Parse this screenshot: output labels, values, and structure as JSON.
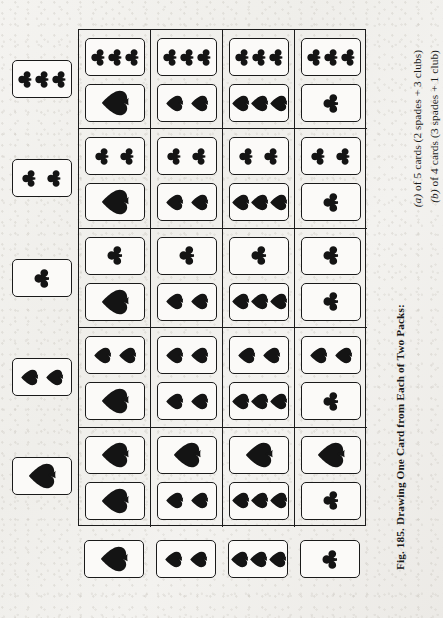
{
  "figure": {
    "number": "Fig. 185.",
    "caption_line1": "Fig. 185. Drawing One Card from Each of Two Packs:",
    "caption_line2": "(a) of 5 cards (2 spades + 3 clubs)",
    "caption_line3": "(b) of 4 cards (3 spades + 1 club)",
    "caption_a_label": "(a)",
    "caption_b_label": "(b)",
    "caption_a_text": " of 5 cards (2 spades + 3 clubs)",
    "caption_b_text": " of 4 cards (3 spades + 1 club)"
  },
  "ink_color": "#141414",
  "paper_color": "#f2f1ee",
  "pack_a": {
    "name": "Pack A",
    "size": 5,
    "composition": "2 spades + 3 clubs",
    "cards": [
      {
        "id": "a-3clubs",
        "suit": "club",
        "count": 3,
        "label": "3 clubs"
      },
      {
        "id": "a-2clubs",
        "suit": "club",
        "count": 2,
        "label": "2 clubs"
      },
      {
        "id": "a-1club",
        "suit": "club",
        "count": 1,
        "label": "1 club"
      },
      {
        "id": "a-2spades",
        "suit": "spade",
        "count": 2,
        "label": "2 spades"
      },
      {
        "id": "a-1spade",
        "suit": "spade",
        "count": 1,
        "label": "1 spade"
      }
    ]
  },
  "pack_b": {
    "name": "Pack B",
    "size": 4,
    "composition": "3 spades + 1 club",
    "cards": [
      {
        "id": "b-1spade",
        "suit": "spade",
        "count": 1,
        "label": "1 spade"
      },
      {
        "id": "b-2spades",
        "suit": "spade",
        "count": 2,
        "label": "2 spades"
      },
      {
        "id": "b-3spades",
        "suit": "spade",
        "count": 3,
        "label": "3 spades"
      },
      {
        "id": "b-1club",
        "suit": "club",
        "count": 1,
        "label": "1 club"
      }
    ]
  },
  "matrix": {
    "rows": 5,
    "cols": 4,
    "total_outcomes": 20,
    "cells": [
      [
        {
          "a": {
            "suit": "club",
            "count": 3
          },
          "b": {
            "suit": "spade",
            "count": 1
          }
        },
        {
          "a": {
            "suit": "club",
            "count": 3
          },
          "b": {
            "suit": "spade",
            "count": 2
          }
        },
        {
          "a": {
            "suit": "club",
            "count": 3
          },
          "b": {
            "suit": "spade",
            "count": 3
          }
        },
        {
          "a": {
            "suit": "club",
            "count": 3
          },
          "b": {
            "suit": "club",
            "count": 1
          }
        }
      ],
      [
        {
          "a": {
            "suit": "club",
            "count": 2
          },
          "b": {
            "suit": "spade",
            "count": 1
          }
        },
        {
          "a": {
            "suit": "club",
            "count": 2
          },
          "b": {
            "suit": "spade",
            "count": 2
          }
        },
        {
          "a": {
            "suit": "club",
            "count": 2
          },
          "b": {
            "suit": "spade",
            "count": 3
          }
        },
        {
          "a": {
            "suit": "club",
            "count": 2
          },
          "b": {
            "suit": "club",
            "count": 1
          }
        }
      ],
      [
        {
          "a": {
            "suit": "club",
            "count": 1
          },
          "b": {
            "suit": "spade",
            "count": 1
          }
        },
        {
          "a": {
            "suit": "club",
            "count": 1
          },
          "b": {
            "suit": "spade",
            "count": 2
          }
        },
        {
          "a": {
            "suit": "club",
            "count": 1
          },
          "b": {
            "suit": "spade",
            "count": 3
          }
        },
        {
          "a": {
            "suit": "club",
            "count": 1
          },
          "b": {
            "suit": "club",
            "count": 1
          }
        }
      ],
      [
        {
          "a": {
            "suit": "spade",
            "count": 2
          },
          "b": {
            "suit": "spade",
            "count": 1
          }
        },
        {
          "a": {
            "suit": "spade",
            "count": 2
          },
          "b": {
            "suit": "spade",
            "count": 2
          }
        },
        {
          "a": {
            "suit": "spade",
            "count": 2
          },
          "b": {
            "suit": "spade",
            "count": 3
          }
        },
        {
          "a": {
            "suit": "spade",
            "count": 2
          },
          "b": {
            "suit": "club",
            "count": 1
          }
        }
      ],
      [
        {
          "a": {
            "suit": "spade",
            "count": 1
          },
          "b": {
            "suit": "spade",
            "count": 1
          }
        },
        {
          "a": {
            "suit": "spade",
            "count": 1
          },
          "b": {
            "suit": "spade",
            "count": 2
          }
        },
        {
          "a": {
            "suit": "spade",
            "count": 1
          },
          "b": {
            "suit": "spade",
            "count": 3
          }
        },
        {
          "a": {
            "suit": "spade",
            "count": 1
          },
          "b": {
            "suit": "club",
            "count": 1
          }
        }
      ]
    ]
  },
  "geometry": {
    "matrix_left": 78,
    "matrix_top": 29,
    "matrix_width": 288,
    "matrix_height": 497,
    "col_width": 72,
    "row_height": 99.4,
    "header_col_left": 12,
    "header_row_top": 540,
    "card_w": 60,
    "card_h": 38
  }
}
